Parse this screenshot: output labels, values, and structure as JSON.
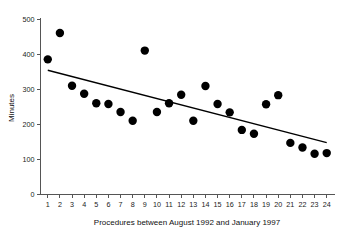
{
  "chart_data": {
    "type": "scatter",
    "title": "",
    "xlabel": "Procedures between August 1992 and January 1997",
    "ylabel": "Minutes",
    "x": [
      1,
      2,
      3,
      4,
      5,
      6,
      7,
      8,
      9,
      10,
      11,
      12,
      13,
      14,
      15,
      16,
      17,
      18,
      19,
      20,
      21,
      22,
      23,
      24
    ],
    "values": [
      385,
      460,
      310,
      287,
      260,
      258,
      235,
      210,
      410,
      235,
      260,
      284,
      210,
      309,
      258,
      234,
      184,
      173,
      257,
      283,
      147,
      134,
      116,
      118
    ],
    "xticklabels": [
      "1",
      "2",
      "3",
      "4",
      "5",
      "6",
      "7",
      "8",
      "9",
      "10",
      "11",
      "12",
      "13",
      "14",
      "15",
      "16",
      "17",
      "18",
      "19",
      "20",
      "21",
      "22",
      "23",
      "24"
    ],
    "yticks": [
      0,
      100,
      200,
      300,
      400,
      500
    ],
    "yticklabels": [
      "0",
      "100",
      "200",
      "300",
      "400",
      "500"
    ],
    "xlim": [
      0.4,
      24.6
    ],
    "ylim": [
      0,
      500
    ],
    "grid": false,
    "legend": false,
    "marker_color": "#000000",
    "marker_size": 4.2,
    "trendline": {
      "name": "linear fit",
      "x_start": 1,
      "y_start": 354,
      "x_end": 24,
      "y_end": 148,
      "color": "#000000"
    }
  }
}
